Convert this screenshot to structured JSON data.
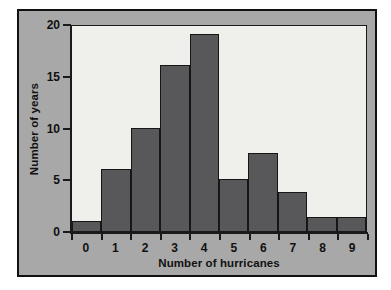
{
  "chart_data": {
    "type": "bar",
    "title": "",
    "xlabel": "Number of hurricanes",
    "ylabel": "Number of years",
    "categories": [
      "0",
      "1",
      "2",
      "3",
      "4",
      "5",
      "6",
      "7",
      "8",
      "9"
    ],
    "values": [
      1,
      6,
      10,
      16,
      19,
      5,
      7.5,
      3.8,
      1.4,
      1.4
    ],
    "xlim": [
      0,
      10
    ],
    "ylim": [
      0,
      20
    ],
    "y_ticks": [
      0,
      5,
      10,
      15,
      20
    ],
    "y_tick_labels": [
      "0",
      "5",
      "10",
      "15",
      "20"
    ],
    "x_tick_labels": [
      "0",
      "1",
      "2",
      "3",
      "4",
      "5",
      "6",
      "7",
      "8",
      "9"
    ],
    "grid": false,
    "legend": null,
    "bar_color": "#58585a",
    "bar_edge_color": "#161616",
    "plot_background": "#efefec",
    "panel_background": "#a8a8a8",
    "frame_color": "#111111",
    "text_color": "#111111"
  }
}
